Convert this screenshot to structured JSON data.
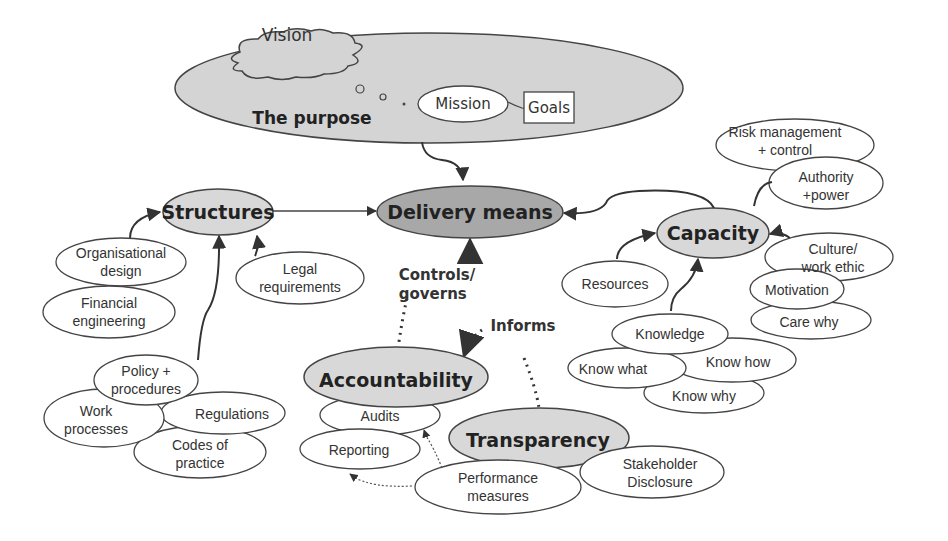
{
  "colors": {
    "background": "#ffffff",
    "stroke": "#444444",
    "hub_fill": "#d8d8d8",
    "delivery_fill": "#a8a8a8",
    "purpose_fill": "#d4d4d4",
    "leaf_fill": "#ffffff"
  },
  "purpose": {
    "title": "The purpose",
    "vision": "Vision",
    "mission": "Mission",
    "goals": "Goals"
  },
  "hubs": {
    "delivery": "Delivery means",
    "structures": "Structures",
    "capacity": "Capacity",
    "accountability": "Accountability",
    "transparency": "Transparency"
  },
  "edge_labels": {
    "controls": "Controls/\ngoverns",
    "informs": "Informs"
  },
  "structures_leaves": {
    "org_design": "Organisational\ndesign",
    "financial": "Financial\nengineering",
    "legal": "Legal\nrequirements",
    "policy": "Policy +\nprocedures",
    "work": "Work\nprocesses",
    "regulations": "Regulations",
    "codes": "Codes of\npractice"
  },
  "capacity_leaves": {
    "risk": "Risk management\n+ control",
    "authority": "Authority\n+power",
    "culture": "Culture/\nwork ethic",
    "motivation": "Motivation",
    "care_why": "Care why",
    "resources": "Resources",
    "knowledge": "Knowledge",
    "know_what": "Know what",
    "know_how": "Know how",
    "know_why": "Know why"
  },
  "accountability_leaves": {
    "audits": "Audits",
    "reporting": "Reporting"
  },
  "transparency_leaves": {
    "performance": "Performance\nmeasures",
    "stakeholder": "Stakeholder\nDisclosure"
  }
}
